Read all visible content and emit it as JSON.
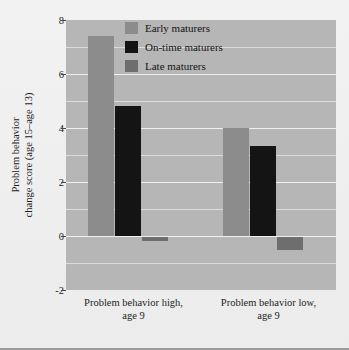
{
  "chart_data": {
    "type": "bar",
    "title": "",
    "subtitle": "",
    "xlabel": "",
    "ylabel": "Problem behavior change score (age 15–age 13)",
    "ylabel_lines": [
      "Problem behavior",
      "change score (age 15–age 13)"
    ],
    "categories": [
      "Problem behavior high, age 9",
      "Problem behavior low, age 9"
    ],
    "category_lines": [
      [
        "Problem behavior high,",
        "age 9"
      ],
      [
        "Problem behavior low,",
        "age 9"
      ]
    ],
    "series": [
      {
        "name": "Early maturers",
        "color": "#8c8c8c",
        "values": [
          7.4,
          4.0
        ]
      },
      {
        "name": "On-time maturers",
        "color": "#141414",
        "values": [
          4.8,
          3.35
        ]
      },
      {
        "name": "Late maturers",
        "color": "#6e6e6e",
        "values": [
          -0.2,
          -0.5
        ]
      }
    ],
    "ylim": [
      -2,
      8
    ],
    "yticks": [
      8,
      6,
      4,
      2,
      0,
      -2
    ],
    "ytick_labels": [
      "8",
      "6",
      "4",
      "2",
      "0",
      "-2"
    ],
    "minor_gridlines": [
      7,
      5,
      3,
      1,
      -1
    ],
    "grid": true,
    "legend_position": "upper center",
    "plot_background": "#b6b6b6",
    "gridline_color": "#f0f0f0",
    "figure_background": "#efefef"
  }
}
